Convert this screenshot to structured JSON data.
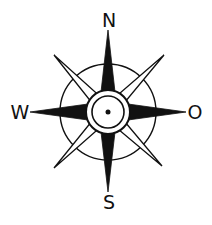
{
  "diagram": {
    "type": "compass-rose",
    "labels": {
      "north": "N",
      "south": "S",
      "west": "W",
      "east": "O"
    },
    "colors": {
      "ink": "#111111",
      "background": "#ffffff"
    }
  }
}
